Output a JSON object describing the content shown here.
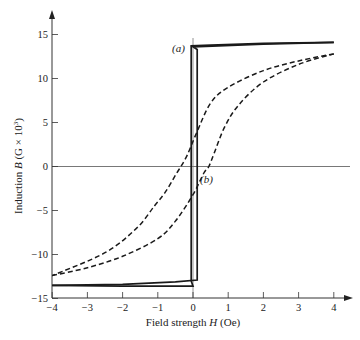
{
  "chart_data": {
    "type": "line",
    "title": "",
    "xlabel": "Field strength H (Oe)",
    "xlabel_parts": {
      "pre": "Field strength ",
      "var": "H",
      "post": " (Oe)"
    },
    "ylabel": "Induction B (G × 10³)",
    "ylabel_parts": {
      "pre": "Induction ",
      "var": "B",
      "post": " (G × 10",
      "sup": "3",
      "close": ")"
    },
    "xlim": [
      -4,
      4
    ],
    "ylim": [
      -15,
      15
    ],
    "x_ticks": [
      -4,
      -3,
      -2,
      -1,
      0,
      1,
      2,
      3,
      4
    ],
    "x_tick_labels": [
      "−4",
      "−3",
      "−2",
      "−1",
      "0",
      "1",
      "2",
      "3",
      "4"
    ],
    "y_ticks": [
      -15,
      -10,
      -5,
      0,
      5,
      10,
      15
    ],
    "y_tick_labels": [
      "−15",
      "−10",
      "−5",
      "0",
      "5",
      "10",
      "15"
    ],
    "grid": false,
    "reference_lines": {
      "h_zero": true,
      "v_zero": true
    },
    "series": [
      {
        "name": "(a)",
        "style": "solid",
        "description": "Square hysteresis loop",
        "branches": [
          {
            "H": [
              4.0,
              2.0,
              0.5,
              -0.05,
              -0.05,
              0.0,
              -2.0,
              -4.0
            ],
            "B": [
              14.1,
              14.0,
              13.8,
              13.7,
              -13.0,
              -13.6,
              -13.6,
              -13.5
            ]
          },
          {
            "H": [
              -4.0,
              -2.0,
              -0.5,
              0.12,
              0.12,
              0.0,
              2.0,
              4.0
            ],
            "B": [
              -13.5,
              -13.4,
              -13.1,
              -12.9,
              13.3,
              13.6,
              13.9,
              14.1
            ]
          }
        ]
      },
      {
        "name": "(b)",
        "style": "dashed",
        "description": "Sheared hysteresis loop",
        "branches": [
          {
            "H": [
              4.0,
              3.0,
              2.0,
              1.0,
              0.5,
              0.1,
              -0.2,
              -0.5,
              -0.8,
              -1.1,
              -1.6,
              -2.5,
              -4.0
            ],
            "B": [
              12.8,
              12.0,
              10.9,
              9.0,
              7.2,
              3.8,
              1.0,
              -1.0,
              -3.0,
              -4.5,
              -7.0,
              -9.8,
              -12.4
            ]
          },
          {
            "H": [
              -4.0,
              -3.0,
              -2.0,
              -1.0,
              -0.5,
              0.0,
              0.3,
              0.45,
              0.6,
              0.9,
              1.3,
              2.0,
              3.0,
              4.0
            ],
            "B": [
              -12.4,
              -11.5,
              -10.2,
              -8.2,
              -6.2,
              -3.2,
              -0.8,
              0.0,
              1.5,
              4.5,
              7.0,
              9.6,
              11.6,
              12.8
            ]
          }
        ]
      }
    ],
    "annotations": [
      {
        "text": "(a)",
        "H": -0.4,
        "B": 13.2
      },
      {
        "text": "(b)",
        "H": 0.45,
        "B": -1.5
      }
    ]
  }
}
